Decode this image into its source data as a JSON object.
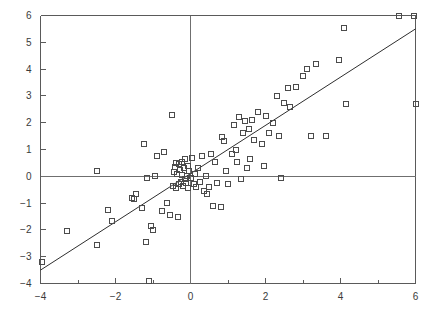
{
  "chart_data": {
    "type": "scatter",
    "title": "",
    "subtitle": "",
    "xlabel": "",
    "ylabel": "",
    "xlim": [
      -4,
      6
    ],
    "ylim": [
      -4,
      6
    ],
    "grid": false,
    "legend": null,
    "legend_position": "none",
    "marker": "open-square",
    "x_major_ticks": [
      -4,
      -2,
      0,
      2,
      4,
      6
    ],
    "x_minor_ticks": [
      -3,
      -1,
      1,
      3,
      5
    ],
    "y_major_ticks": [
      -4,
      -3,
      -2,
      -1,
      0,
      1,
      2,
      3,
      4,
      5,
      6
    ],
    "x_tick_labels": [
      "-4",
      "-2",
      "0",
      "2",
      "4",
      "6"
    ],
    "y_tick_labels": [
      "-4",
      "-3",
      "-2",
      "-1",
      "0",
      "1",
      "2",
      "3",
      "4",
      "5",
      "6"
    ],
    "reference_lines": [
      {
        "name": "x-zero-axis",
        "orientation": "vertical",
        "value": 0
      },
      {
        "name": "y-zero-axis",
        "orientation": "horizontal",
        "value": 0
      }
    ],
    "fit_line": {
      "name": "regression-line",
      "slope": 0.9,
      "intercept": 0.1,
      "x_start": -4,
      "y_start": -3.5,
      "x_end": 6,
      "y_end": 5.5
    },
    "series": [
      {
        "name": "observations",
        "marker": "open-square",
        "points": [
          [
            -3.95,
            -3.2
          ],
          [
            -3.3,
            -2.05
          ],
          [
            -2.5,
            -2.55
          ],
          [
            -2.5,
            0.2
          ],
          [
            -2.2,
            -1.25
          ],
          [
            -2.1,
            -1.65
          ],
          [
            -1.55,
            -0.8
          ],
          [
            -1.5,
            -0.85
          ],
          [
            -1.45,
            -0.65
          ],
          [
            -1.3,
            -1.2
          ],
          [
            -1.25,
            1.2
          ],
          [
            -1.2,
            -2.45
          ],
          [
            -1.15,
            -0.05
          ],
          [
            -1.1,
            -3.9
          ],
          [
            -1.05,
            -1.85
          ],
          [
            -1.0,
            -2.0
          ],
          [
            -0.95,
            0.0
          ],
          [
            -0.9,
            0.75
          ],
          [
            -0.75,
            -1.3
          ],
          [
            -0.7,
            0.9
          ],
          [
            -0.62,
            -1.0
          ],
          [
            -0.55,
            -1.45
          ],
          [
            -0.5,
            2.3
          ],
          [
            -0.48,
            -0.35
          ],
          [
            -0.45,
            0.15
          ],
          [
            -0.42,
            0.35
          ],
          [
            -0.4,
            0.5
          ],
          [
            -0.38,
            -0.45
          ],
          [
            -0.35,
            0.1
          ],
          [
            -0.34,
            -1.5
          ],
          [
            -0.32,
            -0.3
          ],
          [
            -0.3,
            0.45
          ],
          [
            -0.28,
            0.25
          ],
          [
            -0.26,
            -0.2
          ],
          [
            -0.24,
            0.55
          ],
          [
            -0.22,
            0.05
          ],
          [
            -0.2,
            -0.35
          ],
          [
            -0.18,
            0.3
          ],
          [
            -0.16,
            -0.1
          ],
          [
            -0.15,
            0.65
          ],
          [
            -0.12,
            -0.25
          ],
          [
            -0.1,
            0.0
          ],
          [
            -0.08,
            0.4
          ],
          [
            -0.06,
            -0.45
          ],
          [
            -0.05,
            0.2
          ],
          [
            0.0,
            -0.05
          ],
          [
            0.05,
            0.7
          ],
          [
            0.08,
            -0.3
          ],
          [
            0.12,
            0.1
          ],
          [
            0.15,
            -0.4
          ],
          [
            0.2,
            0.3
          ],
          [
            0.25,
            -0.2
          ],
          [
            0.3,
            0.75
          ],
          [
            0.35,
            -0.55
          ],
          [
            0.4,
            0.0
          ],
          [
            0.45,
            -0.65
          ],
          [
            0.5,
            -0.4
          ],
          [
            0.55,
            0.85
          ],
          [
            0.6,
            -1.1
          ],
          [
            0.65,
            0.55
          ],
          [
            0.7,
            -0.25
          ],
          [
            0.8,
            -1.15
          ],
          [
            0.85,
            1.45
          ],
          [
            0.9,
            1.3
          ],
          [
            0.95,
            0.2
          ],
          [
            1.0,
            -0.3
          ],
          [
            1.1,
            0.85
          ],
          [
            1.15,
            1.9
          ],
          [
            1.2,
            1.0
          ],
          [
            1.25,
            0.55
          ],
          [
            1.3,
            2.2
          ],
          [
            1.35,
            -0.1
          ],
          [
            1.4,
            1.6
          ],
          [
            1.45,
            2.05
          ],
          [
            1.5,
            0.3
          ],
          [
            1.55,
            1.75
          ],
          [
            1.6,
            0.65
          ],
          [
            1.65,
            2.1
          ],
          [
            1.7,
            1.35
          ],
          [
            1.8,
            2.4
          ],
          [
            1.9,
            1.2
          ],
          [
            1.95,
            0.4
          ],
          [
            2.0,
            2.25
          ],
          [
            2.1,
            1.6
          ],
          [
            2.2,
            2.0
          ],
          [
            2.3,
            3.0
          ],
          [
            2.35,
            1.5
          ],
          [
            2.4,
            -0.05
          ],
          [
            2.5,
            2.75
          ],
          [
            2.6,
            3.3
          ],
          [
            2.65,
            2.6
          ],
          [
            2.8,
            3.35
          ],
          [
            3.0,
            3.75
          ],
          [
            3.1,
            4.0
          ],
          [
            3.2,
            1.5
          ],
          [
            3.35,
            4.2
          ],
          [
            3.6,
            1.5
          ],
          [
            3.95,
            4.35
          ],
          [
            4.1,
            5.55
          ],
          [
            4.15,
            2.7
          ],
          [
            5.55,
            6.0
          ],
          [
            5.95,
            6.0
          ],
          [
            6.0,
            2.7
          ]
        ]
      }
    ]
  },
  "figure": {
    "background_color": "#ffffff",
    "axis_color": "#5a5a5a",
    "marker_color": "#4b4b4b",
    "line_color": "#2e2e2e"
  }
}
